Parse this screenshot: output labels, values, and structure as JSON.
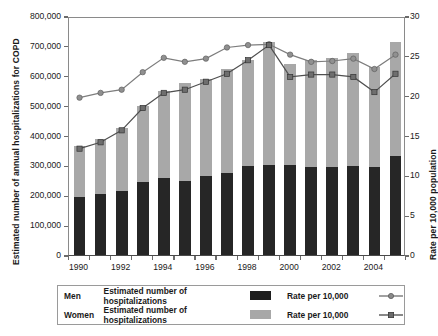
{
  "axes": {
    "y_left_title": "Estimated number of annual hospitalizations for COPD",
    "y_right_title": "Rate per 10,000 population",
    "y_left_ticks": [
      "800,000",
      "700,000",
      "600,000",
      "500,000",
      "400,000",
      "300,000",
      "200,000",
      "100,000",
      "0"
    ],
    "y_right_ticks": [
      "30",
      "25",
      "20",
      "15",
      "10",
      "5",
      "0"
    ],
    "x_ticks_visible": [
      "1990",
      "1992",
      "1994",
      "1996",
      "1998",
      "2000",
      "2002",
      "2004"
    ]
  },
  "legend": {
    "rows": [
      {
        "group": "Men",
        "bar_label": "Estimated number of hospitalizations",
        "bar_color": "#1e1e1e",
        "rate_label": "Rate per 10,000",
        "marker": "circle-marker",
        "line_color": "#6e6e6e"
      },
      {
        "group": "Women",
        "bar_label": "Estimated number of hospitalizations",
        "bar_color": "#a8a8a8",
        "rate_label": "Rate per 10,000",
        "marker": "square-marker",
        "line_color": "#4a4a4a"
      }
    ]
  },
  "chart_data": {
    "type": "bar",
    "subtype": "stacked-bar-with-two-lines",
    "title": "",
    "xlabel": "",
    "ylabel": "Estimated number of annual hospitalizations for COPD",
    "y2label": "Rate per 10,000 population",
    "ylim": [
      0,
      800000
    ],
    "y2lim": [
      0,
      30
    ],
    "grid": false,
    "legend_position": "bottom",
    "categories": [
      1990,
      1991,
      1992,
      1993,
      1994,
      1995,
      1996,
      1997,
      1998,
      1999,
      2000,
      2001,
      2002,
      2003,
      2004,
      2005
    ],
    "tick_labels": [
      "1990",
      "",
      "1992",
      "",
      "1994",
      "",
      "1996",
      "",
      "1998",
      "",
      "2000",
      "",
      "2002",
      "",
      "2004",
      ""
    ],
    "series": [
      {
        "name": "Men — Estimated number of hospitalizations",
        "axis": "left",
        "stack": "bottom",
        "color": "#262626",
        "values": [
          194000,
          203000,
          213000,
          244000,
          257000,
          249000,
          265000,
          273000,
          299000,
          302000,
          302000,
          295000,
          296000,
          297000,
          296000,
          330000
        ]
      },
      {
        "name": "Women — Estimated number of hospitalizations",
        "axis": "left",
        "stack": "top",
        "color": "#a8a8a8",
        "values": [
          171000,
          184000,
          213000,
          256000,
          292000,
          327000,
          323000,
          349000,
          354000,
          412000,
          339000,
          359000,
          364000,
          380000,
          333000,
          382000
        ]
      },
      {
        "name": "Men — Rate per 10,000",
        "axis": "right",
        "type": "line",
        "color": "#6e6e6e",
        "marker": "circle",
        "values": [
          20.0,
          20.6,
          21.0,
          23.2,
          25.0,
          24.5,
          24.9,
          26.3,
          26.6,
          26.7,
          25.4,
          24.5,
          24.6,
          24.9,
          23.6,
          25.4
        ]
      },
      {
        "name": "Women — Rate per 10,000",
        "axis": "right",
        "type": "line",
        "color": "#4a4a4a",
        "marker": "square",
        "values": [
          13.6,
          14.4,
          15.9,
          18.7,
          20.6,
          21.0,
          22.0,
          23.0,
          24.7,
          26.6,
          22.6,
          22.9,
          22.9,
          22.6,
          20.7,
          23.0
        ]
      }
    ]
  }
}
